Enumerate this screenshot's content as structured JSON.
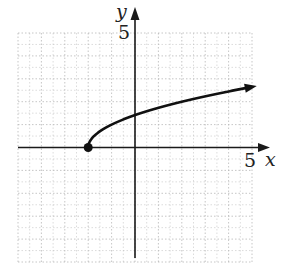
{
  "chart_data": {
    "type": "line",
    "title": "",
    "function": "y = sqrt(x + 2)",
    "xlabel": "x",
    "ylabel": "y",
    "xlim": [
      -5,
      5
    ],
    "ylim": [
      -5,
      5
    ],
    "grid": true,
    "tick_labels": {
      "x": [
        "5"
      ],
      "y": [
        "5"
      ]
    },
    "series": [
      {
        "name": "curve",
        "x": [
          -2,
          -1.75,
          -1.5,
          -1,
          0,
          1,
          2,
          3,
          4,
          5
        ],
        "y": [
          0,
          0.5,
          0.71,
          1,
          1.41,
          1.73,
          2,
          2.24,
          2.45,
          2.65
        ],
        "start_point": {
          "x": -2,
          "y": 0,
          "style": "closed-dot"
        },
        "end": "arrow"
      }
    ]
  },
  "labels": {
    "x_axis": "x",
    "y_axis": "y",
    "x_tick": "5",
    "y_tick": "5"
  },
  "colors": {
    "axis": "#1a1a1a",
    "curve": "#111111",
    "grid": "#b8b8b8"
  }
}
